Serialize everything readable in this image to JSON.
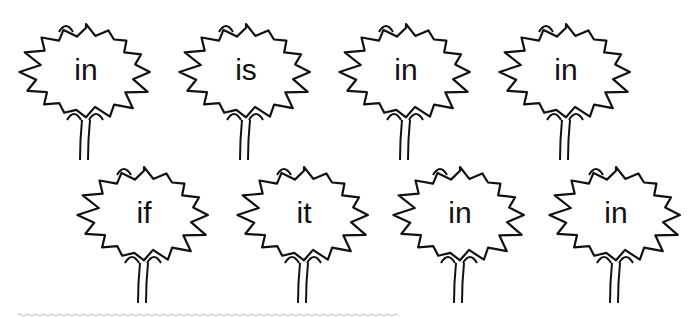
{
  "worksheet": {
    "flowers": [
      {
        "word": "in"
      },
      {
        "word": "is"
      },
      {
        "word": "in"
      },
      {
        "word": "in"
      },
      {
        "word": "if"
      },
      {
        "word": "it"
      },
      {
        "word": "in"
      },
      {
        "word": "in"
      }
    ],
    "colors": {
      "ink": "#111111",
      "background": "#ffffff",
      "dash": "#bbbbbb"
    }
  }
}
